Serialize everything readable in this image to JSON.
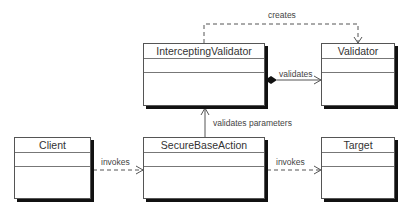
{
  "diagram": {
    "type": "UML class diagram",
    "classes": [
      {
        "id": "intercepting-validator",
        "name": "InterceptingValidator"
      },
      {
        "id": "validator",
        "name": "Validator"
      },
      {
        "id": "client",
        "name": "Client"
      },
      {
        "id": "secure-base-action",
        "name": "SecureBaseAction"
      },
      {
        "id": "target",
        "name": "Target"
      }
    ],
    "relations": [
      {
        "from": "InterceptingValidator",
        "to": "Validator",
        "kind": "dependency",
        "label": "creates"
      },
      {
        "from": "InterceptingValidator",
        "to": "Validator",
        "kind": "composition",
        "label": "validates"
      },
      {
        "from": "SecureBaseAction",
        "to": "InterceptingValidator",
        "kind": "association",
        "label": "validates parameters"
      },
      {
        "from": "Client",
        "to": "SecureBaseAction",
        "kind": "dependency",
        "label": "invokes"
      },
      {
        "from": "SecureBaseAction",
        "to": "Target",
        "kind": "dependency",
        "label": "invokes"
      }
    ]
  }
}
